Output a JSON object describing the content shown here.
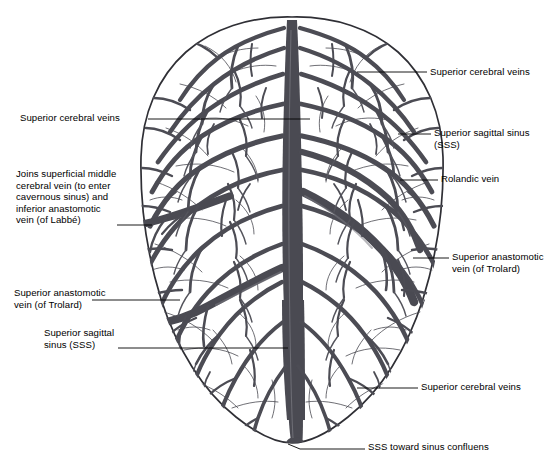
{
  "figure": {
    "view": "superior view of the brain showing cortical veins draining into the superior sagittal sinus"
  },
  "colors": {
    "vein": "#4c4c54",
    "vein_light": "#6b6b73",
    "outline": "#2f2f35",
    "sinus": "#4a4a52",
    "leader": "#000000",
    "text": "#000000",
    "background": "#ffffff"
  },
  "labels": [
    {
      "id": "superior-cerebral-veins-top-right",
      "lines": [
        "Superior cerebral veins"
      ],
      "side": "right",
      "x": 430,
      "y": 66,
      "leader": {
        "x1": 357,
        "y1": 72,
        "x2": 427,
        "y2": 72
      }
    },
    {
      "id": "superior-cerebral-veins-left",
      "lines": [
        "Superior cerebral veins"
      ],
      "side": "left",
      "x": 20,
      "y": 112,
      "leader": {
        "x1": 148,
        "y1": 119,
        "x2": 310,
        "y2": 119
      }
    },
    {
      "id": "superior-sagittal-sinus-right",
      "lines": [
        "Superior sagittal sinus",
        "(SSS)"
      ],
      "side": "right",
      "x": 434,
      "y": 127,
      "leader": {
        "x1": 398,
        "y1": 134,
        "x2": 431,
        "y2": 134
      }
    },
    {
      "id": "rolandic-vein",
      "lines": [
        "Rolandic vein"
      ],
      "side": "right",
      "x": 441,
      "y": 173,
      "leader": {
        "x1": 400,
        "y1": 180,
        "x2": 438,
        "y2": 180
      }
    },
    {
      "id": "labbe-complex",
      "lines": [
        "Joins superficial middle",
        "cerebral vein (to enter",
        "cavernous sinus) and",
        "inferior anastomotic",
        "vein (of Labbé)"
      ],
      "side": "left",
      "x": 16,
      "y": 168,
      "leader": {
        "x1": 117,
        "y1": 225,
        "x2": 152,
        "y2": 225
      }
    },
    {
      "id": "superior-anastomotic-vein-trolard-right",
      "lines": [
        "Superior anastomotic",
        "vein (of Trolard)"
      ],
      "side": "right",
      "x": 452,
      "y": 251,
      "leader": {
        "x1": 413,
        "y1": 258,
        "x2": 449,
        "y2": 258
      }
    },
    {
      "id": "superior-anastomotic-vein-trolard-left",
      "lines": [
        "Superior anastomotic",
        "vein (of Trolard)"
      ],
      "side": "left",
      "x": 14,
      "y": 287,
      "leader": {
        "x1": 92,
        "y1": 300,
        "x2": 180,
        "y2": 300
      }
    },
    {
      "id": "superior-sagittal-sinus-left",
      "lines": [
        "Superior sagittal",
        "sinus (SSS)"
      ],
      "side": "left",
      "x": 44,
      "y": 327,
      "leader": {
        "x1": 118,
        "y1": 348,
        "x2": 288,
        "y2": 348
      }
    },
    {
      "id": "superior-cerebral-veins-bottom-right",
      "lines": [
        "Superior cerebral veins"
      ],
      "side": "right",
      "x": 421,
      "y": 381,
      "leader": {
        "x1": 357,
        "y1": 388,
        "x2": 418,
        "y2": 388
      }
    },
    {
      "id": "sss-toward-sinus-confluens",
      "lines": [
        "SSS toward sinus confluens"
      ],
      "side": "right",
      "x": 368,
      "y": 441,
      "leader": {
        "x1": 288,
        "y1": 446,
        "x2": 365,
        "y2": 448
      }
    }
  ],
  "anatomy": {
    "brain_outline": "ovoid superior view, left edge x=140, right edge x=418, top y=17, bottom y=443",
    "midline_x": 292,
    "structures": [
      "superior sagittal sinus (vertical midline trunk)",
      "superior cerebral (bridging) veins",
      "Rolandic vein",
      "superior anastomotic vein of Trolard",
      "inferior anastomotic vein of Labbé"
    ]
  }
}
